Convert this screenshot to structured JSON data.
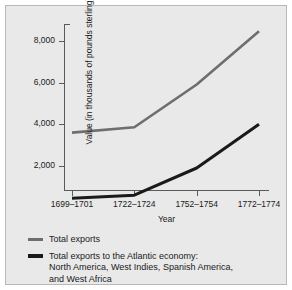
{
  "chart_data": {
    "type": "line",
    "title": "",
    "xlabel": "Year",
    "ylabel": "Value (in thousands of pounds sterling)",
    "categories": [
      "1699–1701",
      "1722–1724",
      "1752–1754",
      "1772–1774"
    ],
    "ytick_labels": [
      "8,000",
      "6,000",
      "4,000",
      "2,000"
    ],
    "ytick_values": [
      8000,
      6000,
      4000,
      2000
    ],
    "ylim": [
      800,
      8800
    ],
    "grid": false,
    "legend_position": "below",
    "series": [
      {
        "name": "Total exports",
        "color": "#6e6e6e",
        "values": [
          3600,
          3850,
          5900,
          8450
        ]
      },
      {
        "name": "Total exports to the Atlantic economy: North America, West Indies, Spanish America, and West Africa",
        "color": "#1a1a1a",
        "values": [
          450,
          600,
          1900,
          4000
        ]
      }
    ]
  },
  "legend": {
    "entries": [
      {
        "lines": [
          "Total exports"
        ]
      },
      {
        "lines": [
          "Total exports to the Atlantic economy:",
          "North America, West Indies, Spanish America,",
          "and West Africa"
        ]
      }
    ]
  },
  "colors": {
    "figure_background": "#e9e9e9",
    "frame": "#b8b8b8",
    "axis": "#5a5a5a",
    "series_total_exports": "#6e6e6e",
    "series_atlantic": "#1a1a1a",
    "text": "#1a1a1a"
  }
}
